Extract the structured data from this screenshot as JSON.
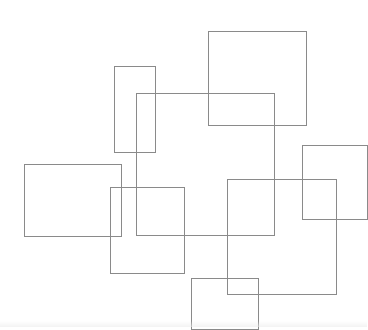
{
  "canvas": {
    "width": 367,
    "height": 327,
    "background": "#ffffff",
    "stroke": "#8a8a8a"
  },
  "rectangles": [
    {
      "id": "tall-narrow",
      "x": 114,
      "y": 66,
      "w": 42,
      "h": 87
    },
    {
      "id": "central-large",
      "x": 136,
      "y": 93,
      "w": 139,
      "h": 143
    },
    {
      "id": "top-right",
      "x": 208,
      "y": 31,
      "w": 99,
      "h": 95
    },
    {
      "id": "right-edge",
      "x": 302,
      "y": 145,
      "w": 66,
      "h": 75
    },
    {
      "id": "left",
      "x": 24,
      "y": 164,
      "w": 98,
      "h": 73
    },
    {
      "id": "lower-middle",
      "x": 110,
      "y": 187,
      "w": 75,
      "h": 87
    },
    {
      "id": "lower-right-large",
      "x": 227,
      "y": 179,
      "w": 110,
      "h": 116
    },
    {
      "id": "bottom",
      "x": 191,
      "y": 278,
      "w": 68,
      "h": 52
    }
  ]
}
